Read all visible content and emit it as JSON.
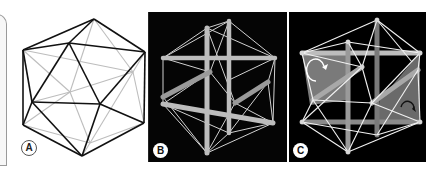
{
  "figure": {
    "panels": [
      {
        "id": "A",
        "label": "A",
        "description": "Line drawing of icosahedron, front edges black, hidden edges gray"
      },
      {
        "id": "B",
        "label": "B",
        "description": "Rendered tensegrity icosahedron with six struts and cables on black background"
      },
      {
        "id": "C",
        "label": "C",
        "description": "Tensegrity icosahedron with shaded planes and rotation arrows on black background"
      }
    ],
    "colors": {
      "edge_front": "#111111",
      "edge_hidden": "#bdbdbd",
      "panel_background": "#000000",
      "strut": "#b8b8b8",
      "cable": "#e6e6e6",
      "shaded_plane": "#7a7a7a"
    }
  }
}
